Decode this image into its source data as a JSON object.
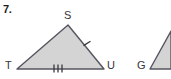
{
  "page": {
    "background_color": "#ffffff",
    "problem_number": "7."
  },
  "figures": [
    {
      "name": "triangle-stu",
      "type": "triangle",
      "fill_color": "#d4d4d4",
      "stroke_color": "#555560",
      "vertices": [
        {
          "label": "S",
          "x": 68,
          "y": 25
        },
        {
          "label": "T",
          "x": 17,
          "y": 69
        },
        {
          "label": "U",
          "x": 104,
          "y": 69
        }
      ],
      "tick_marks": [
        {
          "side": "TU",
          "count": 3
        },
        {
          "side": "SU",
          "count": 1
        }
      ]
    },
    {
      "name": "triangle-g-partial",
      "type": "triangle-partial",
      "fill_color": "#d4d4d4",
      "stroke_color": "#555560",
      "vertices": [
        {
          "label": "G",
          "x": 150,
          "y": 69
        }
      ]
    }
  ],
  "labels": {
    "problem_number": "7.",
    "vertex_s": "S",
    "vertex_t": "T",
    "vertex_u": "U",
    "vertex_g": "G"
  }
}
